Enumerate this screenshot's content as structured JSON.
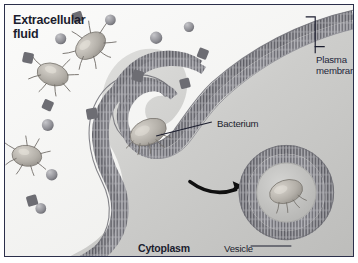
{
  "figure": {
    "width": 358,
    "height": 263,
    "border_color": "#2b2f4a",
    "background_color": "#f4f4f2"
  },
  "labels": {
    "extracellular_fluid": "Extracellular\nfluid",
    "plasma_membrane": "Plasma\nmembrane",
    "bacterium": "Bacterium",
    "cytoplasm": "Cytoplasm",
    "vesicle": "Vesicle"
  },
  "colors": {
    "label_text": "#1b1d2e",
    "membrane_head": "#6e6e74",
    "membrane_tail": "#9a9aa0",
    "membrane_core": "#58585e",
    "cytoplasm_fill": "#c9c9c7",
    "extracellular_fill": "#f7f7f6",
    "bacterium_body": "#b6b3ad",
    "particle_sphere": "#8f8f94",
    "particle_cube": "#6d6d73",
    "arrow": "#101010",
    "leader_line": "#1b1d2e"
  },
  "scene": {
    "regions": [
      {
        "name": "extracellular-fluid",
        "description": "light region upper-left outside the cell"
      },
      {
        "name": "cytoplasm",
        "description": "gray region lower-right inside the cell"
      }
    ],
    "structures": [
      {
        "name": "plasma-membrane",
        "description": "phospholipid bilayer drawn as a double comb of lipid heads and tails"
      },
      {
        "name": "membrane-invagination",
        "description": "membrane folds inward forming an engulfment pocket around a bacterium"
      },
      {
        "name": "engulfed-bacterium",
        "description": "bacterium inside the membrane pocket"
      },
      {
        "name": "phagocytic-vesicle",
        "description": "closed circular vesicle containing the bacterium"
      },
      {
        "name": "process-arrow",
        "description": "curved black arrow from pocket to vesicle"
      }
    ],
    "free_bacteria_count": 3,
    "free_sphere_particles_count": 6,
    "free_cube_particles_count": 8
  }
}
